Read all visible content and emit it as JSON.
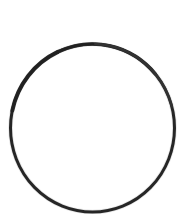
{
  "canvas": {
    "width": 193,
    "height": 214,
    "background_color": "#ffffff",
    "title": ""
  },
  "figure": {
    "name": "circle-outline",
    "description": "Single hand-drawn black circle outline on a plain white background",
    "shape_type": "circle",
    "filled": false,
    "fill_color": "none",
    "stroke_color": "#1a1a1a",
    "stroke_width": 3,
    "center_x": 92.5,
    "center_y": 128,
    "radius_x": 82,
    "radius_y": 84,
    "bounds": {
      "left": 10,
      "top": 44,
      "right": 175,
      "bottom": 212
    },
    "clipped_at_bottom": true,
    "interior_content": ""
  },
  "labels": {
    "text_items": []
  }
}
